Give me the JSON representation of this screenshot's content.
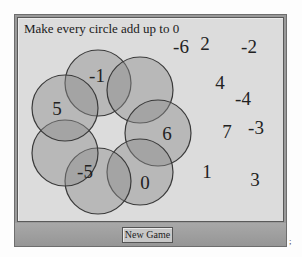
{
  "game": {
    "instruction": "Make every circle add up to 0",
    "new_game_label": "New Game",
    "colors": {
      "panel_bg": "#dcdcdc",
      "frame": "#9a9a9a",
      "circle_fill": "#8c8c8c",
      "circle_stroke": "#3a3a3a"
    }
  },
  "circles": [
    {
      "id": 1,
      "cx": 98,
      "cy": 83
    },
    {
      "id": 2,
      "cx": 140,
      "cy": 90
    },
    {
      "id": 3,
      "cx": 158,
      "cy": 133
    },
    {
      "id": 4,
      "cx": 140,
      "cy": 172
    },
    {
      "id": 5,
      "cx": 98,
      "cy": 181
    },
    {
      "id": 6,
      "cx": 65,
      "cy": 153
    },
    {
      "id": 7,
      "cx": 65,
      "cy": 108
    }
  ],
  "placed_numbers": [
    {
      "value": "-1",
      "x": 97,
      "y": 75
    },
    {
      "value": "5",
      "x": 57,
      "y": 108
    },
    {
      "value": "6",
      "x": 167,
      "y": 133
    },
    {
      "value": "-5",
      "x": 85,
      "y": 171
    },
    {
      "value": "0",
      "x": 145,
      "y": 182
    }
  ],
  "available_numbers": [
    {
      "value": "-6",
      "x": 181,
      "y": 46
    },
    {
      "value": "2",
      "x": 205,
      "y": 43
    },
    {
      "value": "-2",
      "x": 249,
      "y": 46
    },
    {
      "value": "4",
      "x": 220,
      "y": 82
    },
    {
      "value": "-4",
      "x": 243,
      "y": 98
    },
    {
      "value": "7",
      "x": 227,
      "y": 131
    },
    {
      "value": "-3",
      "x": 256,
      "y": 127
    },
    {
      "value": "1",
      "x": 207,
      "y": 171
    },
    {
      "value": "3",
      "x": 255,
      "y": 179
    }
  ],
  "trailing_mark": ";"
}
